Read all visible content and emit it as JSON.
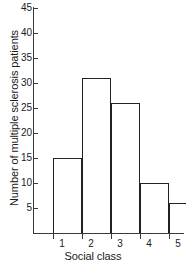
{
  "chart_data": {
    "type": "bar",
    "title": "",
    "subtitle": "",
    "xlabel": "Social class",
    "ylabel": "Number of multiple sclerosis patients",
    "categories": [
      "1",
      "2",
      "3",
      "4",
      "5"
    ],
    "values": [
      15,
      31,
      26,
      10,
      6
    ],
    "series": [
      {
        "name": "Number of multiple sclerosis patients",
        "values": [
          15,
          31,
          26,
          10,
          6
        ]
      }
    ],
    "ylim": [
      0,
      45
    ],
    "y_ticks": [
      5,
      10,
      15,
      20,
      25,
      30,
      35,
      40,
      45
    ],
    "y_tick_labels": [
      "5",
      "10",
      "15",
      "20",
      "25",
      "30",
      "35",
      "40",
      "45"
    ],
    "x_tick_labels": [
      "1",
      "2",
      "3",
      "4",
      "5"
    ],
    "grid": false,
    "legend": false,
    "legend_position": "none",
    "bar_fill_color": "#ffffff",
    "bar_edge_color": "#222222",
    "axis_color": "#3a3a3a",
    "background_color": "#ffffff",
    "text_color": "#1a1a1a",
    "annotations": []
  }
}
